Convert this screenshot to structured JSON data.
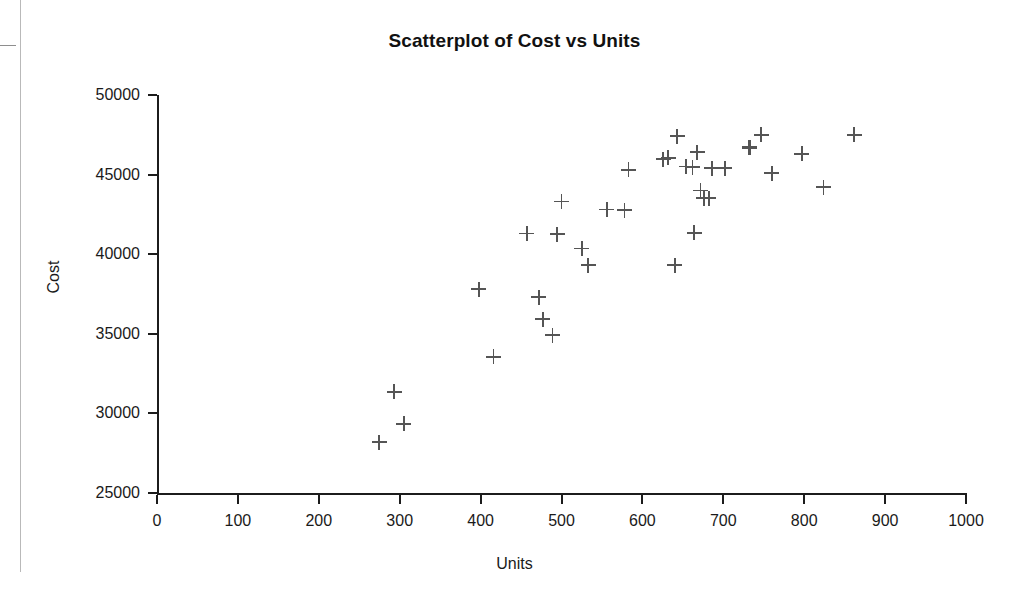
{
  "chart_data": {
    "type": "scatter",
    "title": "Scatterplot of Cost vs Units",
    "xlabel": "Units",
    "ylabel": "Cost",
    "xlim": [
      0,
      1000
    ],
    "ylim": [
      25000,
      50000
    ],
    "xticks": [
      0,
      100,
      200,
      300,
      400,
      500,
      600,
      700,
      800,
      900,
      1000
    ],
    "yticks": [
      25000,
      30000,
      35000,
      40000,
      45000,
      50000
    ],
    "grid": false,
    "legend": null,
    "marker": "plus",
    "marker_color": "#555555",
    "axis_color": "#1c1c1c",
    "background": "#ffffff",
    "points": [
      {
        "x": 275,
        "y": 28200
      },
      {
        "x": 293,
        "y": 31350
      },
      {
        "x": 305,
        "y": 29350
      },
      {
        "x": 398,
        "y": 37800
      },
      {
        "x": 416,
        "y": 33550
      },
      {
        "x": 457,
        "y": 41300
      },
      {
        "x": 472,
        "y": 37300
      },
      {
        "x": 477,
        "y": 35900
      },
      {
        "x": 489,
        "y": 34900
      },
      {
        "x": 495,
        "y": 41250
      },
      {
        "x": 500,
        "y": 43300
      },
      {
        "x": 525,
        "y": 40350
      },
      {
        "x": 533,
        "y": 39300
      },
      {
        "x": 556,
        "y": 42800
      },
      {
        "x": 578,
        "y": 42750
      },
      {
        "x": 583,
        "y": 45300
      },
      {
        "x": 626,
        "y": 45950
      },
      {
        "x": 632,
        "y": 46050
      },
      {
        "x": 640,
        "y": 39300
      },
      {
        "x": 643,
        "y": 47400
      },
      {
        "x": 654,
        "y": 45500
      },
      {
        "x": 662,
        "y": 45450
      },
      {
        "x": 664,
        "y": 41350
      },
      {
        "x": 668,
        "y": 46400
      },
      {
        "x": 672,
        "y": 44000
      },
      {
        "x": 676,
        "y": 43500
      },
      {
        "x": 682,
        "y": 43500
      },
      {
        "x": 686,
        "y": 45400
      },
      {
        "x": 702,
        "y": 45400
      },
      {
        "x": 733,
        "y": 46700
      },
      {
        "x": 747,
        "y": 47500
      },
      {
        "x": 760,
        "y": 45100
      },
      {
        "x": 797,
        "y": 46300
      },
      {
        "x": 824,
        "y": 44200
      },
      {
        "x": 862,
        "y": 47500
      }
    ]
  }
}
